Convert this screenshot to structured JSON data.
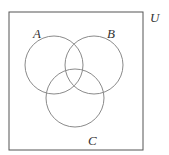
{
  "diagram": {
    "type": "venn",
    "universe": {
      "label": "U",
      "x": 9,
      "y": 12,
      "width": 134,
      "height": 138
    },
    "sets": [
      {
        "label": "A",
        "cx": 54,
        "cy": 65,
        "r": 29,
        "label_x": 33,
        "label_y": 38
      },
      {
        "label": "B",
        "cx": 94,
        "cy": 65,
        "r": 29,
        "label_x": 107,
        "label_y": 38
      },
      {
        "label": "C",
        "cx": 75,
        "cy": 98,
        "r": 29,
        "label_x": 88,
        "label_y": 144
      }
    ],
    "colors": {
      "stroke": "#8a8a8a",
      "box_stroke": "#555555",
      "text": "#333333"
    }
  }
}
